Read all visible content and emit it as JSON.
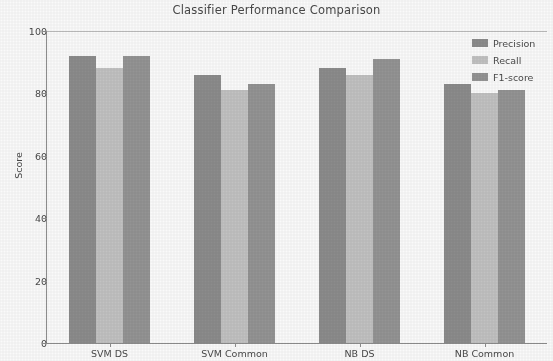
{
  "chart_data": {
    "type": "bar",
    "title": "Classifier Performance Comparison",
    "xlabel": "",
    "ylabel": "Score",
    "ylim": [
      0,
      100
    ],
    "yticks": [
      0,
      20,
      40,
      60,
      80,
      100
    ],
    "categories": [
      "SVM DS",
      "SVM Common",
      "NB DS",
      "NB Common"
    ],
    "grid": false,
    "legend_position": "upper right",
    "series": [
      {
        "name": "Precision",
        "color": "#8a8a8a",
        "values": [
          92,
          86,
          88,
          83
        ]
      },
      {
        "name": "Recall",
        "color": "#c2c2c2",
        "values": [
          88,
          81,
          86,
          80
        ]
      },
      {
        "name": "F1-score",
        "color": "#929292",
        "values": [
          92,
          83,
          91,
          81
        ]
      }
    ]
  },
  "axis": {
    "ytick_labels": [
      "0",
      "20",
      "40",
      "60",
      "80",
      "100"
    ],
    "ylabel": "Score"
  },
  "legend": {
    "items": [
      {
        "label": "Precision"
      },
      {
        "label": "Recall"
      },
      {
        "label": "F1-score"
      }
    ]
  }
}
